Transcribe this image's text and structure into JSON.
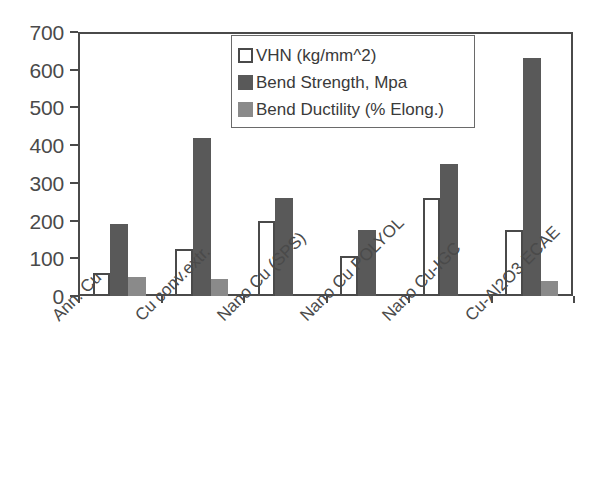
{
  "chart_data": {
    "type": "bar",
    "title": "",
    "xlabel": "",
    "ylabel": "",
    "ylim": [
      0,
      700
    ],
    "yticks": [
      0,
      100,
      200,
      300,
      400,
      500,
      600,
      700
    ],
    "grid": false,
    "legend_position": "top-center",
    "categories": [
      "Ann. Cu",
      "Cu conv.extr.",
      "Nano Cu (SPS)",
      "Nano Cu POLYOL",
      "Nano Cu-IGC",
      "Cu-Al2O3 ECAE"
    ],
    "series": [
      {
        "name": "VHN (kg/mm^2)",
        "color": "#ffffff",
        "values": [
          60,
          125,
          200,
          105,
          260,
          175
        ]
      },
      {
        "name": "Bend Strength, Mpa",
        "color": "#595959",
        "values": [
          190,
          420,
          260,
          175,
          350,
          630
        ]
      },
      {
        "name": "Bend Ductility (% Elong.)",
        "color": "#8a8a8a",
        "values": [
          50,
          45,
          0,
          0,
          0,
          40
        ]
      }
    ]
  },
  "axis": {
    "frame_color": "#4a4a4a"
  }
}
